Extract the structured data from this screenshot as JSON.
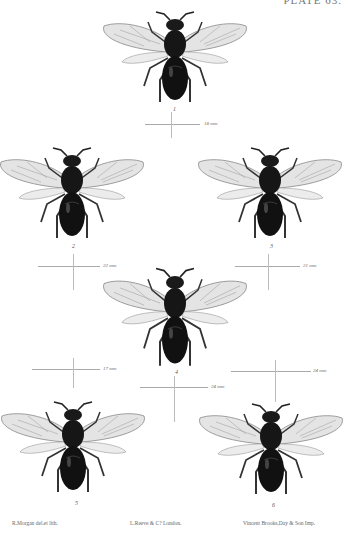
{
  "plate": {
    "title": "PLATE 63."
  },
  "figures": [
    {
      "number": "1",
      "scale": "18 mm"
    },
    {
      "number": "2",
      "scale": "22 mm"
    },
    {
      "number": "3",
      "scale": "21 mm"
    },
    {
      "number": "4",
      "scale": "24 mm"
    },
    {
      "number": "5",
      "scale": "17 mm"
    },
    {
      "number": "6",
      "scale": "24 mm"
    }
  ],
  "credits": {
    "artist": "R.Morgan del.et lith.",
    "publisher": "L.Reeve & C? London.",
    "printer": "Vincent Brooks,Day & Son Imp."
  },
  "colors": {
    "body": "#1a1a1a",
    "wing": "#d8d8d8",
    "vein": "#777777",
    "background": "#ffffff"
  }
}
